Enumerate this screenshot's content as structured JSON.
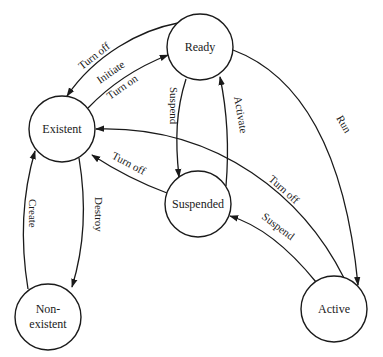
{
  "diagram": {
    "title": "",
    "colors": {
      "stroke": "#1a1a1a",
      "background": "#ffffff"
    },
    "nodes": [
      {
        "id": "ready",
        "label": "Ready"
      },
      {
        "id": "existent",
        "label": "Existent"
      },
      {
        "id": "suspended",
        "label": "Suspended"
      },
      {
        "id": "nonexistent",
        "label_line1": "Non-",
        "label_line2": "existent"
      },
      {
        "id": "active",
        "label": "Active"
      }
    ],
    "edges": [
      {
        "from": "ready",
        "to": "existent",
        "label": "Turn off"
      },
      {
        "from": "existent",
        "to": "ready",
        "label_line1": "Initiate",
        "label_line2": "Turn on"
      },
      {
        "from": "ready",
        "to": "suspended",
        "label": "Suspend"
      },
      {
        "from": "suspended",
        "to": "ready",
        "label": "Activate"
      },
      {
        "from": "ready",
        "to": "active",
        "label": "Run"
      },
      {
        "from": "suspended",
        "to": "existent",
        "label": "Turn off"
      },
      {
        "from": "active",
        "to": "existent",
        "label": "Turn off"
      },
      {
        "from": "active",
        "to": "suspended",
        "label": "Suspend"
      },
      {
        "from": "nonexistent",
        "to": "existent",
        "label": "Create"
      },
      {
        "from": "existent",
        "to": "nonexistent",
        "label": "Destroy"
      }
    ]
  }
}
